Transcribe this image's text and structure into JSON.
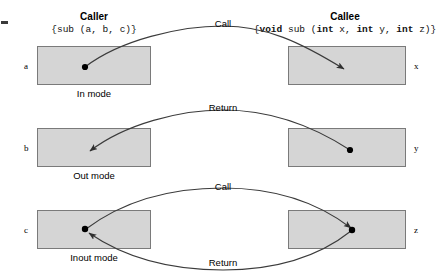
{
  "figure": {
    "title_left": "Caller",
    "title_right": "Callee",
    "signature_left": "{sub (a, b, c)}",
    "signature_left_parts": {
      "pre": "{sub (a, b, c)}"
    },
    "signature_right_parts": {
      "open": "{",
      "kw1": "void",
      "mid1": " sub (",
      "kw2": "int",
      "mid2": " x, ",
      "kw3": "int",
      "mid3": " y, ",
      "kw4": "int",
      "mid4": " z)}"
    },
    "box_fill": "#d5d5d5",
    "box_stroke": "#7a7a7a",
    "line_color": "#3b3b3b",
    "dot_color": "#000000"
  },
  "rows": [
    {
      "id": "in-mode",
      "mode_label": "In mode",
      "caller_var": "a",
      "callee_var": "x",
      "edges": [
        {
          "label": "Call",
          "direction": "caller-to-callee"
        }
      ]
    },
    {
      "id": "out-mode",
      "mode_label": "Out mode",
      "caller_var": "b",
      "callee_var": "y",
      "edges": [
        {
          "label": "Return",
          "direction": "callee-to-caller"
        }
      ]
    },
    {
      "id": "inout-mode",
      "mode_label": "Inout mode",
      "caller_var": "c",
      "callee_var": "z",
      "edges": [
        {
          "label": "Call",
          "direction": "caller-to-callee"
        },
        {
          "label": "Return",
          "direction": "callee-to-caller"
        }
      ]
    }
  ]
}
